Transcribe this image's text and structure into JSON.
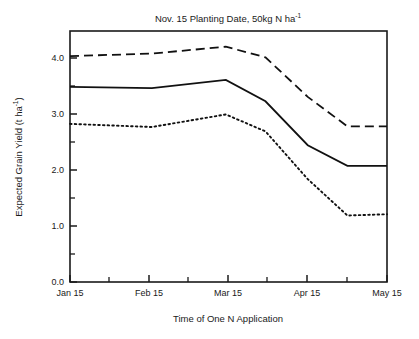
{
  "chart_data": {
    "type": "line",
    "title": "Nov. 15 Planting Date, 50kg N ha",
    "title_sup": "-1",
    "xlabel": "Time of One N Application",
    "ylabel": "Expected Grain Yield (t ha",
    "ylabel_sup": "-1",
    "ylabel_tail": ")",
    "xlim": [
      0,
      120
    ],
    "ylim": [
      0.0,
      4.0
    ],
    "grid": false,
    "legend": "none",
    "x_tick_labels": [
      "Jan 15",
      "Feb 15",
      "Mar 15",
      "Apr 15",
      "May 15"
    ],
    "x_tick_values": [
      0,
      31,
      59,
      90,
      120
    ],
    "x_minor_tick_values": [
      15,
      45,
      74,
      105
    ],
    "y_tick_labels": [
      "0.0",
      "1.0",
      "2.0",
      "3.0",
      "4.0"
    ],
    "y_tick_values": [
      0.0,
      1.0,
      2.0,
      3.0,
      4.0
    ],
    "y_minor_tick_values": [
      0.5,
      1.5,
      2.5,
      3.5
    ],
    "x": [
      0,
      31,
      59,
      74,
      90,
      105,
      120
    ],
    "series": [
      {
        "name": "upper",
        "style": "dashed",
        "values": [
          3.6,
          3.64,
          3.75,
          3.58,
          2.95,
          2.48,
          2.48
        ]
      },
      {
        "name": "middle",
        "style": "solid",
        "values": [
          3.11,
          3.09,
          3.22,
          2.88,
          2.18,
          1.85,
          1.85
        ]
      },
      {
        "name": "lower",
        "style": "dotted",
        "values": [
          2.52,
          2.47,
          2.67,
          2.4,
          1.64,
          1.06,
          1.08
        ]
      }
    ]
  }
}
